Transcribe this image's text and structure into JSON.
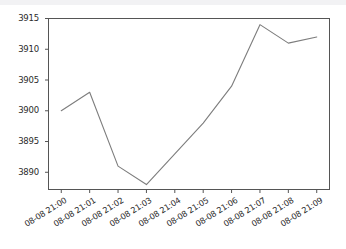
{
  "chart_data": {
    "type": "line",
    "title": "",
    "xlabel": "",
    "ylabel": "",
    "categories": [
      "08-08 21:00",
      "08-08 21:01",
      "08-08 21:02",
      "08-08 21:03",
      "08-08 21:04",
      "08-08 21:05",
      "08-08 21:06",
      "08-08 21:07",
      "08-08 21:08",
      "08-08 21:09"
    ],
    "values": [
      3900,
      3903,
      3891,
      3888,
      3893,
      3898,
      3904,
      3914,
      3911,
      3912
    ],
    "yticks": [
      3890,
      3895,
      3900,
      3905,
      3910,
      3915
    ],
    "ylim": [
      3887.2,
      3915.0
    ],
    "xlim": [
      -0.45,
      9.45
    ],
    "grid": false,
    "legend": null,
    "series": [
      {
        "name": "value",
        "color": "#7d7d7d",
        "values": [
          3900,
          3903,
          3891,
          3888,
          3893,
          3898,
          3904,
          3914,
          3911,
          3912
        ]
      }
    ]
  },
  "figure": {
    "line_color": "#7d7d7d",
    "axes_color": "#555555",
    "background": "#ffffff",
    "tick_text_color": "#2b2b2b"
  }
}
